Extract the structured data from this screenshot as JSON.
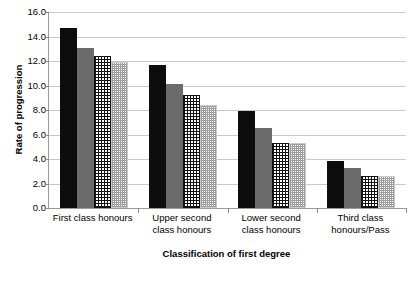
{
  "chart_data": {
    "type": "bar",
    "title": "",
    "xlabel": "Classification of first degree",
    "ylabel": "Rate of progression",
    "ylim": [
      0.0,
      16.0
    ],
    "ytick_step": 2.0,
    "yticks": [
      "16.0",
      "14.0",
      "12.0",
      "10.0",
      "8.0",
      "6.0",
      "4.0",
      "2.0",
      "0.0"
    ],
    "grid": true,
    "legend": "none",
    "categories": [
      "First class honours",
      "Upper second\nclass honours",
      "Lower second\nclass honours",
      "Third class\nhonours/Pass"
    ],
    "series": [
      {
        "name": "series-1",
        "style": "solid-black",
        "color": "#0d0d0d",
        "values": [
          14.7,
          11.7,
          7.95,
          3.85
        ]
      },
      {
        "name": "series-2",
        "style": "solid-gray",
        "color": "#6b6b6b",
        "values": [
          13.1,
          10.1,
          6.5,
          3.3
        ]
      },
      {
        "name": "series-3",
        "style": "cross-hatch",
        "color": "#111111",
        "values": [
          12.4,
          9.2,
          5.3,
          2.6
        ]
      },
      {
        "name": "series-4",
        "style": "fine-dotted",
        "color": "#9e9e9e",
        "values": [
          11.9,
          8.4,
          5.3,
          2.6
        ]
      }
    ]
  }
}
